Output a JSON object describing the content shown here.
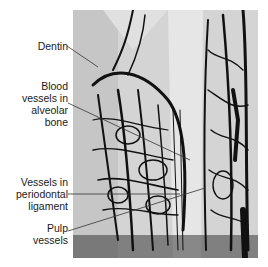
{
  "figure": {
    "labels": [
      {
        "id": "dentin",
        "text": "Dentin"
      },
      {
        "id": "alveolar",
        "lines": [
          "Blood",
          "vessels in",
          "alveolar",
          "bone"
        ]
      },
      {
        "id": "periodontal",
        "lines": [
          "Vessels in",
          "periodontal",
          "ligament"
        ]
      },
      {
        "id": "pulp",
        "lines": [
          "Pulp",
          "vessels"
        ]
      }
    ]
  }
}
